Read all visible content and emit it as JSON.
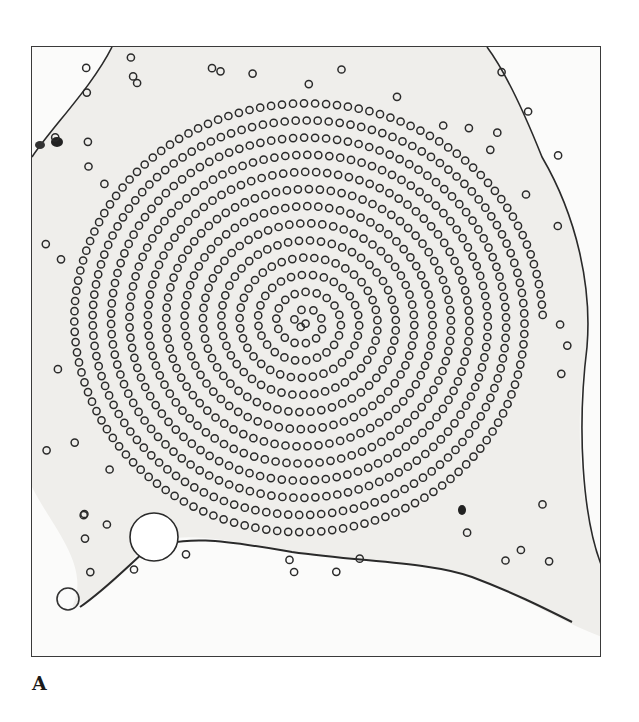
{
  "figure": {
    "panel_label": "A",
    "image_description": "Electron micrograph cross-section of a cell showing a spiral array of microtubule rings",
    "colors": {
      "background": "#ffffff",
      "cytoplasm": "#ecebe8",
      "ring": "#2b2b2b",
      "membrane": "#2a2a2a",
      "frame": "#3a3a3a"
    },
    "spiral": {
      "center_x": 272,
      "center_y": 275,
      "turns": 13,
      "spacing": 17.5,
      "ring_step": 10.5,
      "ring_radius": 3.6
    }
  }
}
